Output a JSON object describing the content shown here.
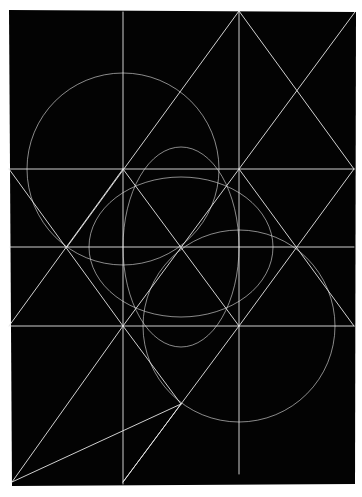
{
  "artwork": {
    "title": "Geometric line composition",
    "background_color": "#ffffff",
    "panel_color": "#030303",
    "line_color": "#e6e6e6",
    "panel": {
      "x1": 9,
      "y1": 10,
      "x2": 356,
      "y2": 12,
      "x3": 355,
      "y3": 484,
      "x4": 12,
      "y4": 486
    },
    "verticals": [
      {
        "x": 123,
        "y1": 12,
        "y2": 484
      },
      {
        "x": 239,
        "y1": 11,
        "y2": 474
      }
    ],
    "horizontals": [
      {
        "y": 169,
        "x1": 9,
        "x2": 354
      },
      {
        "y": 247,
        "x1": 10,
        "x2": 354
      },
      {
        "y": 326,
        "x1": 10,
        "x2": 354
      }
    ],
    "diagonals": [
      {
        "x1": 239,
        "y1": 11,
        "x2": 67,
        "y2": 247
      },
      {
        "x1": 239,
        "y1": 11,
        "x2": 354,
        "y2": 169
      },
      {
        "x1": 355,
        "y1": 12,
        "x2": 123,
        "y2": 326
      },
      {
        "x1": 123,
        "y1": 326,
        "x2": 12,
        "y2": 482
      },
      {
        "x1": 9,
        "y1": 169,
        "x2": 123,
        "y2": 326
      },
      {
        "x1": 123,
        "y1": 326,
        "x2": 181,
        "y2": 404
      },
      {
        "x1": 354,
        "y1": 169,
        "x2": 239,
        "y2": 326
      },
      {
        "x1": 239,
        "y1": 326,
        "x2": 181,
        "y2": 404
      },
      {
        "x1": 181,
        "y1": 404,
        "x2": 123,
        "y2": 482
      },
      {
        "x1": 9,
        "y1": 326,
        "x2": 123,
        "y2": 169
      },
      {
        "x1": 123,
        "y1": 169,
        "x2": 239,
        "y2": 326
      },
      {
        "x1": 239,
        "y1": 169,
        "x2": 354,
        "y2": 326
      },
      {
        "x1": 181,
        "y1": 404,
        "x2": 12,
        "y2": 482
      },
      {
        "x1": 123,
        "y1": 482,
        "x2": 181,
        "y2": 404
      }
    ],
    "circles": [
      {
        "cx": 123,
        "cy": 169,
        "r": 96
      },
      {
        "cx": 239,
        "cy": 326,
        "r": 96
      },
      {
        "cx": 181,
        "cy": 247,
        "rx": 92,
        "ry": 70
      },
      {
        "cx": 181,
        "cy": 247,
        "rx": 58,
        "ry": 100
      }
    ]
  }
}
